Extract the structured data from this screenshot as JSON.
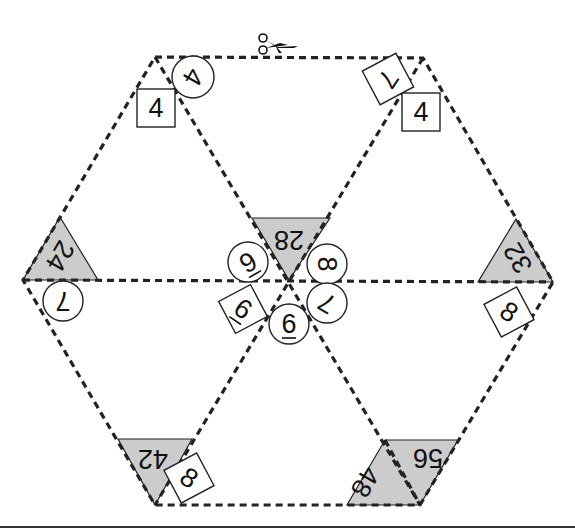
{
  "puzzle": {
    "title_icon": "scissors-icon",
    "colors": {
      "line": "#222222",
      "shade": "#cccccc",
      "background": "#ffffff"
    },
    "hexagon": {
      "vertices": [
        [
          155,
          57
        ],
        [
          423,
          58
        ],
        [
          553,
          282
        ],
        [
          420,
          505
        ],
        [
          155,
          505
        ],
        [
          23,
          280
        ]
      ],
      "center": [
        289,
        280
      ]
    },
    "shaded_regions": [
      {
        "id": "shade-28",
        "label": "28",
        "points": [
          [
            252,
            218
          ],
          [
            330,
            218
          ],
          [
            289,
            280
          ]
        ],
        "text_pos": [
          289,
          240
        ],
        "text_rot": 180
      },
      {
        "id": "shade-24",
        "label": "24",
        "points": [
          [
            60,
            217
          ],
          [
            98,
            280
          ],
          [
            23,
            280
          ]
        ],
        "text_pos": [
          60,
          256
        ],
        "text_rot": 120
      },
      {
        "id": "shade-32",
        "label": "32",
        "points": [
          [
            516,
            219
          ],
          [
            553,
            282
          ],
          [
            478,
            282
          ]
        ],
        "text_pos": [
          518,
          258
        ],
        "text_rot": -120
      },
      {
        "id": "shade-42",
        "label": "42",
        "points": [
          [
            118,
            439
          ],
          [
            192,
            439
          ],
          [
            155,
            505
          ]
        ],
        "text_pos": [
          153,
          459
        ],
        "text_rot": 180
      },
      {
        "id": "shade-48-56",
        "label": "",
        "points": [
          [
            385,
            440
          ],
          [
            458,
            440
          ],
          [
            420,
            505
          ],
          [
            347,
            505
          ]
        ],
        "text_pos": [
          0,
          0
        ],
        "text_rot": 0
      }
    ],
    "parallelogram_labels": [
      {
        "label": "48",
        "pos": [
          365,
          482
        ],
        "rot": 120
      },
      {
        "label": "56",
        "pos": [
          428,
          458
        ],
        "rot": 180
      }
    ],
    "circles": [
      {
        "label": "4",
        "cx": 193,
        "cy": 77,
        "r": 21,
        "rot": 120
      },
      {
        "label": "9̅",
        "display": "6",
        "mark": "over",
        "cx": 248,
        "cy": 262,
        "r": 20,
        "rot": 150
      },
      {
        "label": "8",
        "cx": 327,
        "cy": 264,
        "r": 20,
        "rot": 90
      },
      {
        "label": "7",
        "cx": 327,
        "cy": 303,
        "r": 20,
        "rot": 210
      },
      {
        "label": "6",
        "mark": "under",
        "cx": 289,
        "cy": 324,
        "r": 20,
        "rot": 0
      },
      {
        "label": "7",
        "cx": 63,
        "cy": 301,
        "r": 20,
        "rot": 180
      }
    ],
    "squares": [
      {
        "label": "4",
        "cx": 156,
        "cy": 108,
        "size": 38,
        "rot": 0,
        "text_rot": 0
      },
      {
        "label": "4",
        "cx": 421,
        "cy": 112,
        "size": 38,
        "rot": 0,
        "text_rot": 0
      },
      {
        "label": "7",
        "cx": 388,
        "cy": 79,
        "size": 38,
        "rot": -28,
        "text_rot": 152
      },
      {
        "label": "6",
        "mark": "under",
        "cx": 243,
        "cy": 309,
        "size": 36,
        "rot": -28,
        "text_rot": 62
      },
      {
        "label": "8",
        "cx": 509,
        "cy": 312,
        "size": 37,
        "rot": -28,
        "text_rot": 62
      },
      {
        "label": "8",
        "cx": 189,
        "cy": 478,
        "size": 37,
        "rot": -28,
        "text_rot": 62
      }
    ],
    "interior_lines": [
      [
        [
          23,
          280
        ],
        [
          553,
          282
        ]
      ],
      [
        [
          155,
          57
        ],
        [
          420,
          505
        ]
      ],
      [
        [
          423,
          58
        ],
        [
          155,
          505
        ]
      ]
    ],
    "bottom_rule_y": 527
  }
}
